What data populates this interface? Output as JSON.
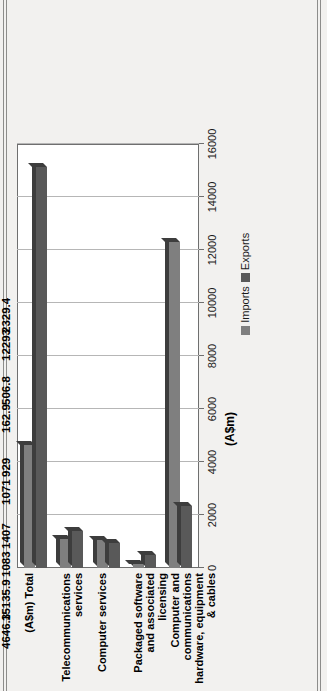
{
  "chart_data": {
    "type": "bar",
    "title": "",
    "subtitle": "",
    "xlabel": "(A$m)",
    "ylabel": "",
    "categories": [
      "(A$m) Total",
      "Telecommunications services",
      "Computer services",
      "Packaged software and associated licensing",
      "Computer and communications hardware, equipment & cables"
    ],
    "series": [
      {
        "name": "Imports",
        "color": "#7f7f7f",
        "values": [
          4646.3,
          1083,
          1071,
          162.9,
          12293
        ]
      },
      {
        "name": "Exports",
        "color": "#595959",
        "values": [
          15135.9,
          1407,
          929,
          506.8,
          2329.4
        ]
      }
    ],
    "value_labels": [
      [
        "4646.3",
        "15135.9"
      ],
      [
        "1083",
        "1407"
      ],
      [
        "1071",
        "929"
      ],
      [
        "162.9",
        "506.8"
      ],
      [
        "12293",
        "2329.4"
      ]
    ],
    "axis_ticks": [
      0,
      2000,
      4000,
      6000,
      8000,
      10000,
      12000,
      14000,
      16000
    ],
    "axis_tick_labels": [
      "0",
      "2000",
      "4000",
      "6000",
      "8000",
      "10000",
      "12000",
      "14000",
      "16000"
    ],
    "xlim": [
      0,
      16000
    ],
    "grid": true,
    "legend_position": "right",
    "legend": [
      {
        "label": "Imports",
        "color": "#7f7f7f"
      },
      {
        "label": "Exports",
        "color": "#595959"
      }
    ]
  },
  "axis": {
    "unit_label": "(A$m)"
  }
}
